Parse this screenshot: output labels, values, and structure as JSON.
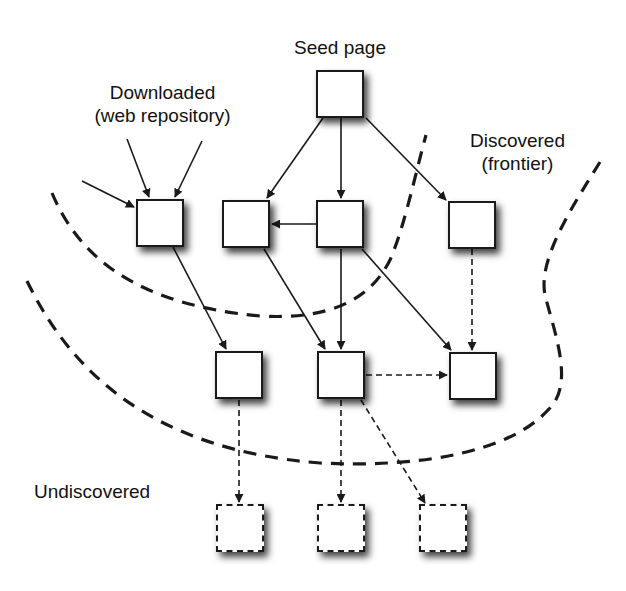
{
  "figure": {
    "colors": {
      "stroke": "#1a1a1a",
      "background": "#ffffff",
      "box_fill": "#ffffff"
    }
  },
  "labels": {
    "seed": "Seed page",
    "downloaded_line1": "Downloaded",
    "downloaded_line2": "(web repository)",
    "discovered_line1": "Discovered",
    "discovered_line2": "(frontier)",
    "undiscovered": "Undiscovered"
  },
  "nodes": [
    {
      "id": "seed",
      "x": 316,
      "y": 70,
      "style": "solid",
      "region": "downloaded"
    },
    {
      "id": "d1",
      "x": 136,
      "y": 199,
      "style": "solid",
      "region": "downloaded"
    },
    {
      "id": "d2",
      "x": 222,
      "y": 200,
      "style": "solid",
      "region": "downloaded"
    },
    {
      "id": "d3",
      "x": 316,
      "y": 200,
      "style": "solid",
      "region": "downloaded"
    },
    {
      "id": "f1",
      "x": 448,
      "y": 201,
      "style": "solid",
      "region": "frontier"
    },
    {
      "id": "f2",
      "x": 215,
      "y": 351,
      "style": "solid",
      "region": "frontier"
    },
    {
      "id": "f3",
      "x": 317,
      "y": 351,
      "style": "solid",
      "region": "frontier"
    },
    {
      "id": "f4",
      "x": 449,
      "y": 352,
      "style": "solid",
      "region": "frontier"
    },
    {
      "id": "u1",
      "x": 216,
      "y": 504,
      "style": "dashed",
      "region": "undiscovered"
    },
    {
      "id": "u2",
      "x": 317,
      "y": 504,
      "style": "dashed",
      "region": "undiscovered"
    },
    {
      "id": "u3",
      "x": 419,
      "y": 504,
      "style": "dashed",
      "region": "undiscovered"
    }
  ],
  "edges": [
    {
      "from": "ext",
      "to": "d1",
      "style": "solid"
    },
    {
      "from": "ext",
      "to": "d1",
      "style": "solid"
    },
    {
      "from": "ext",
      "to": "d1",
      "style": "solid"
    },
    {
      "from": "seed",
      "to": "d2",
      "style": "solid"
    },
    {
      "from": "seed",
      "to": "d3",
      "style": "solid"
    },
    {
      "from": "seed",
      "to": "f1",
      "style": "solid"
    },
    {
      "from": "d3",
      "to": "d2",
      "style": "solid"
    },
    {
      "from": "d1",
      "to": "f2",
      "style": "solid"
    },
    {
      "from": "d2",
      "to": "f3",
      "style": "solid"
    },
    {
      "from": "d3",
      "to": "f3",
      "style": "solid"
    },
    {
      "from": "d3",
      "to": "f4",
      "style": "solid"
    },
    {
      "from": "f1",
      "to": "f4",
      "style": "dashed"
    },
    {
      "from": "f3",
      "to": "f4",
      "style": "dashed"
    },
    {
      "from": "f2",
      "to": "u1",
      "style": "dashed"
    },
    {
      "from": "f3",
      "to": "u2",
      "style": "dashed"
    },
    {
      "from": "f3",
      "to": "u3",
      "style": "dashed"
    }
  ],
  "boundaries": [
    {
      "name": "downloaded-boundary",
      "style": "dashed"
    },
    {
      "name": "frontier-boundary",
      "style": "dashed"
    }
  ]
}
